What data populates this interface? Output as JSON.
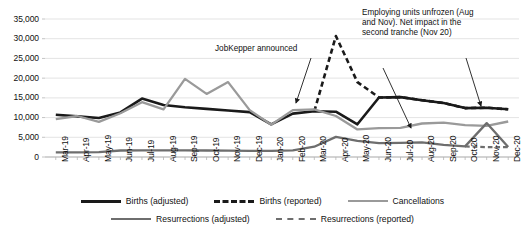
{
  "chart_data": {
    "type": "line",
    "title": "",
    "xlabel": "",
    "ylabel": "",
    "ylim": [
      0,
      35000
    ],
    "ytick_values": [
      0,
      5000,
      10000,
      15000,
      20000,
      25000,
      30000,
      35000
    ],
    "ytick_labels": [
      "0",
      "5,000",
      "10,000",
      "15,000",
      "20,000",
      "25,000",
      "30,000",
      "35,000"
    ],
    "grid": true,
    "legend_position": "bottom",
    "categories": [
      "Mar-19",
      "Apr-19",
      "May-19",
      "Jun-19",
      "Jul-19",
      "Aug-19",
      "Sep-19",
      "Oct-19",
      "Nov-19",
      "Dec-19",
      "Jan-20",
      "Feb-20",
      "Mar-20",
      "Apr-20",
      "May-20",
      "Jun-20",
      "Jul-20",
      "Aug-20",
      "Sep-20",
      "Oct-20",
      "Nov-20",
      "Dec-20"
    ],
    "series": [
      {
        "name": "Births (adjusted)",
        "color": "#1a1a1a",
        "width": 2.6,
        "dash": "none",
        "values": [
          10700,
          10300,
          9900,
          11300,
          14800,
          13200,
          12600,
          12200,
          11800,
          11400,
          8300,
          11000,
          11600,
          11500,
          8300,
          15100,
          15200,
          14400,
          13700,
          12400,
          12500,
          12100
        ]
      },
      {
        "name": "Births (reported)",
        "color": "#1a1a1a",
        "width": 2.6,
        "dash": "dashed",
        "values": [
          null,
          null,
          null,
          null,
          null,
          null,
          null,
          null,
          null,
          null,
          null,
          null,
          11600,
          30700,
          19000,
          15100,
          15200,
          14400,
          13700,
          12400,
          12500,
          12100
        ]
      },
      {
        "name": "Cancellations",
        "color": "#9a9a9a",
        "width": 2.3,
        "dash": "none",
        "values": [
          9600,
          10400,
          8900,
          11100,
          13900,
          12100,
          19800,
          16000,
          19000,
          11900,
          8200,
          11900,
          12100,
          10400,
          7000,
          7300,
          7400,
          8500,
          8700,
          8100,
          7900,
          9000
        ]
      },
      {
        "name": "Resurrections (adjusted)",
        "color": "#6e6e6e",
        "width": 2.3,
        "dash": "none",
        "values": [
          1200,
          1200,
          1250,
          1650,
          1700,
          1700,
          1700,
          1650,
          1600,
          1550,
          1550,
          1700,
          2600,
          5100,
          4100,
          3500,
          3600,
          3700,
          3100,
          2700,
          8600,
          2500
        ]
      },
      {
        "name": "Resurrections (reported)",
        "color": "#6e6e6e",
        "width": 2.3,
        "dash": "dashed",
        "values": [
          null,
          null,
          null,
          null,
          null,
          null,
          null,
          null,
          null,
          null,
          null,
          null,
          null,
          null,
          null,
          null,
          null,
          null,
          null,
          2700,
          2500,
          2500
        ]
      }
    ],
    "annotations": [
      {
        "id": "jobkeeper",
        "text": "JobKepper announced",
        "lines": [
          "JobKepper announced"
        ]
      },
      {
        "id": "unfrozen",
        "text": "Employing units unfrozen (Aug and Nov). Net impact in the second tranche (Nov 20)",
        "lines": [
          "Employing units unfrozen (Aug",
          "and Nov). Net impact in the",
          "second tranche (Nov 20)"
        ]
      }
    ]
  },
  "legend": {
    "row1": [
      {
        "label": "Births (adjusted)",
        "color": "#1a1a1a",
        "dash": "none",
        "width": 3
      },
      {
        "label": "Births (reported)",
        "color": "#1a1a1a",
        "dash": "dashed",
        "width": 3
      },
      {
        "label": "Cancellations",
        "color": "#9a9a9a",
        "dash": "none",
        "width": 2
      }
    ],
    "row2": [
      {
        "label": "Resurrections (adjusted)",
        "color": "#6e6e6e",
        "dash": "none",
        "width": 2
      },
      {
        "label": "Resurrections (reported)",
        "color": "#6e6e6e",
        "dash": "dashed",
        "width": 2
      }
    ]
  }
}
